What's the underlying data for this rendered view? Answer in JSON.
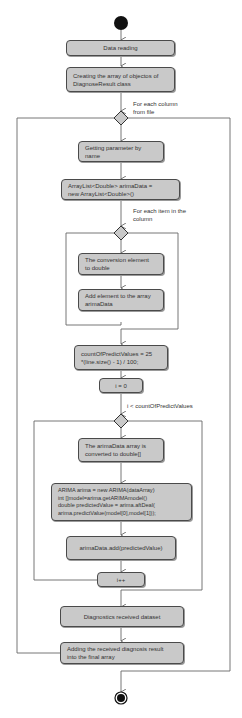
{
  "diagram": {
    "type": "uml-activity-diagram",
    "colors": {
      "node_fill": "#c9c9c9",
      "node_border": "#4a4a4a",
      "line": "#666666",
      "start_end": "#111111"
    },
    "nodes": {
      "start": "initial-node",
      "data_reading": "Data reading",
      "create_array": "Creating the array of objectos of\nDiagnoseResult class",
      "get_param": "Getting parameter by\nname",
      "arraylist": "ArrayList<Double> arimaData =\nnew ArrayList<Double>()",
      "convert_element": "The conversion element\nto double",
      "add_element": "Add element to the array\narimaData",
      "count_predict": "countOfPredictValues = 25\n*(line.size() - 1) / 100;",
      "i_init": "i = 0",
      "convert_array": "The arimaData array is\nconverted to double[]",
      "arima_block": "ARIMA arima = new ARIMA(dataArray)\nint []model=arima.getARIMAmodel()\ndouble predictedValue = arima.aftDeal(\narima.predictValue(model[0],model[1]));",
      "add_predicted": "arimaData.add(predictedValue)",
      "i_increment": "i++",
      "diagnostics": "Diagnostics received dataset",
      "add_result": "Adding the received diagnosis result\ninto the final array",
      "end": "final-node"
    },
    "guards": {
      "each_column": "For each column\nfrom file",
      "each_item": "For each item in the\ncolumn",
      "loop_condition": "i < countOfPredictValues"
    }
  }
}
